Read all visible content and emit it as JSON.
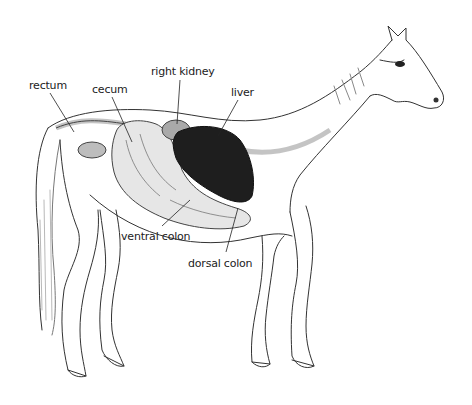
{
  "diagram": {
    "labels": [
      {
        "id": "rectum",
        "text": "rectum",
        "x": 29,
        "y": 79
      },
      {
        "id": "cecum",
        "text": "cecum",
        "x": 92,
        "y": 83
      },
      {
        "id": "right-kidney",
        "text": "right kidney",
        "x": 151,
        "y": 65
      },
      {
        "id": "liver",
        "text": "liver",
        "x": 231,
        "y": 86
      },
      {
        "id": "ventral-colon",
        "text": "ventral colon",
        "x": 121,
        "y": 230
      },
      {
        "id": "dorsal-colon",
        "text": "dorsal colon",
        "x": 188,
        "y": 257
      }
    ],
    "colors": {
      "outline": "#333333",
      "liver": "#1e1e1e",
      "organ_fill": "#e6e6e6",
      "kidney_fill": "#a9a9a9",
      "tract_fill": "#bdbdbd"
    }
  }
}
